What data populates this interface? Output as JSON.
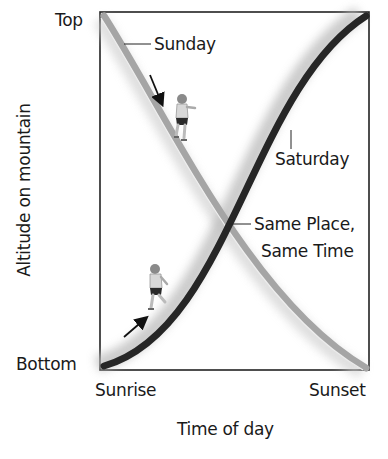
{
  "diagram": {
    "y_axis": {
      "label": "Altitude on mountain",
      "top_label": "Top",
      "bottom_label": "Bottom"
    },
    "x_axis": {
      "label": "Time of day",
      "start_label": "Sunrise",
      "end_label": "Sunset"
    },
    "curves": [
      {
        "name": "Sunday",
        "label": "Sunday",
        "direction": "descending",
        "color": "#a8a8a8"
      },
      {
        "name": "Saturday",
        "label": "Saturday",
        "direction": "ascending",
        "color": "#2a2a2a"
      }
    ],
    "intersection": {
      "label_line1": "Same Place,",
      "label_line2": "Same Time"
    },
    "icons": [
      "hiker-descending-icon",
      "hiker-ascending-icon",
      "arrow-down-icon",
      "arrow-up-icon"
    ]
  }
}
